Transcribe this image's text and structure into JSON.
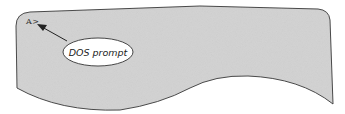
{
  "diagram": {
    "screen_prompt": "A>",
    "callout_label": "DOS prompt",
    "colors": {
      "screen_fill": "#d2d2d2",
      "outline": "#333333",
      "callout_fill": "#ffffff"
    }
  }
}
